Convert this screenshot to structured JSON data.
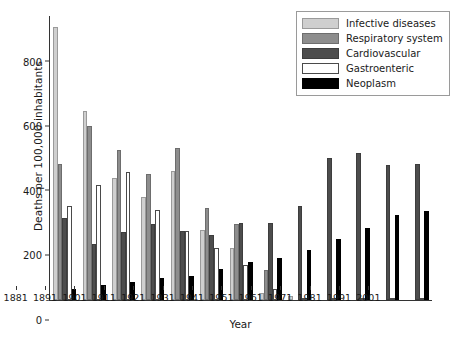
{
  "chart_data": {
    "type": "bar",
    "title": "",
    "xlabel": "Year",
    "ylabel": "Deaths per 100,000 inhabitants",
    "ylim": [
      0,
      880
    ],
    "yticks": [
      0,
      200,
      400,
      600,
      800
    ],
    "grid": false,
    "legend_position": "top-right",
    "categories": [
      "1881",
      "1891",
      "1901",
      "1911",
      "1921",
      "1931",
      "1941",
      "1951",
      "1961",
      "1971",
      "1981",
      "1991",
      "2001"
    ],
    "series": [
      {
        "name": "Infective diseases",
        "color": "#cfcfcf",
        "values": [
          845,
          585,
          378,
          320,
          400,
          218,
          160,
          22,
          12,
          0,
          0,
          0,
          0
        ]
      },
      {
        "name": "Respiratory system",
        "color": "#8d8d8d",
        "values": [
          420,
          540,
          465,
          392,
          470,
          285,
          235,
          92,
          0,
          0,
          0,
          0,
          0
        ]
      },
      {
        "name": "Cardiovascular",
        "color": "#4d4d4d",
        "values": [
          255,
          175,
          210,
          235,
          215,
          200,
          238,
          240,
          290,
          440,
          455,
          418,
          420
        ]
      },
      {
        "name": "Gastroenteric",
        "color": "#ffffff",
        "values": [
          290,
          355,
          398,
          278,
          215,
          160,
          110,
          35,
          6,
          5,
          6,
          4,
          6
        ]
      },
      {
        "name": "Neoplasm",
        "color": "#000000",
        "values": [
          35,
          48,
          55,
          68,
          73,
          95,
          118,
          130,
          155,
          188,
          222,
          262,
          275
        ]
      }
    ]
  }
}
